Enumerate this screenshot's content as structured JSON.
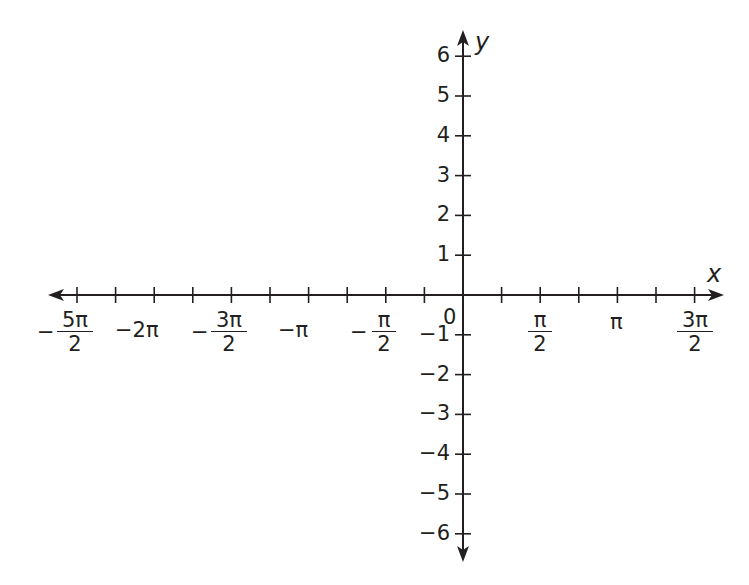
{
  "chart_data": {
    "type": "line",
    "title": "",
    "xlabel": "x",
    "ylabel": "y",
    "grid": false,
    "legend": null,
    "series": [],
    "xlim": [
      -2.6,
      1.7
    ],
    "xlim_units": "multiples of pi",
    "ylim": [
      -6.5,
      6.5
    ],
    "x_tick_step": "pi/4",
    "x_ticks_minor": [
      "-5pi/2",
      "-9pi/4",
      "-2pi",
      "-7pi/4",
      "-3pi/2",
      "-5pi/4",
      "-pi",
      "-3pi/4",
      "-pi/2",
      "-pi/4",
      "0",
      "pi/4",
      "pi/2",
      "3pi/4",
      "pi",
      "5pi/4",
      "3pi/2"
    ],
    "x_tick_labels": [
      {
        "value": "-5pi/2",
        "sign": "−",
        "num": "5π",
        "den": "2"
      },
      {
        "value": "-2pi",
        "text": "−2π"
      },
      {
        "value": "-3pi/2",
        "sign": "−",
        "num": "3π",
        "den": "2"
      },
      {
        "value": "-pi",
        "text": "−π"
      },
      {
        "value": "-pi/2",
        "sign": "−",
        "num": "π",
        "den": "2"
      },
      {
        "value": "0",
        "text": "0"
      },
      {
        "value": "pi/2",
        "num": "π",
        "den": "2"
      },
      {
        "value": "pi",
        "text": "π"
      },
      {
        "value": "3pi/2",
        "num": "3π",
        "den": "2"
      }
    ],
    "y_ticks": [
      6,
      5,
      4,
      3,
      2,
      1,
      -1,
      -2,
      -3,
      -4,
      -5,
      -6
    ],
    "y_tick_labels": [
      "6",
      "5",
      "4",
      "3",
      "2",
      "1",
      "−1",
      "−2",
      "−3",
      "−4",
      "−5",
      "−6"
    ],
    "annotations": []
  },
  "axes": {
    "x_name": "x",
    "y_name": "y",
    "origin_label": "0"
  },
  "colors": {
    "ink": "#231f20",
    "background": "#ffffff"
  }
}
